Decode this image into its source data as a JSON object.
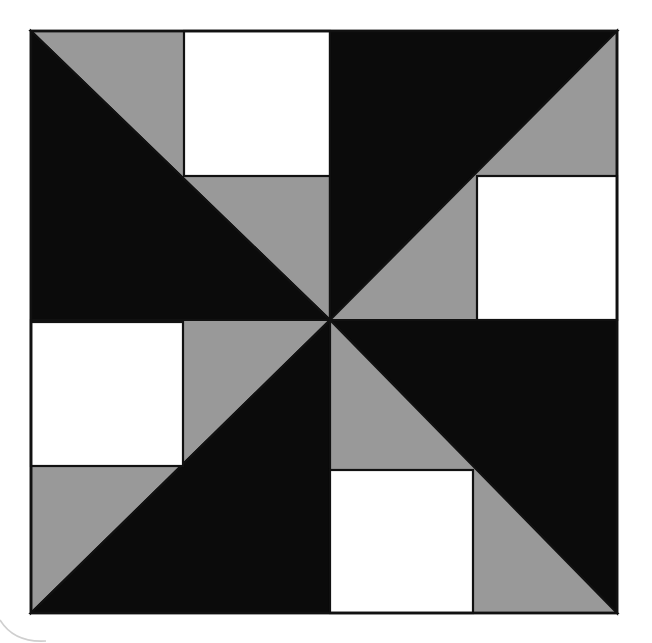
{
  "figure": {
    "name": "pinwheel-quilt-block",
    "kind": "geometric-pattern-diagram",
    "canvas": {
      "width": 652,
      "height": 643,
      "background": "#ffffff"
    },
    "block": {
      "x": 31,
      "y": 31,
      "width": 586,
      "height": 582,
      "center_x": 330,
      "center_y": 320,
      "mid_x": 330,
      "mid_y": 320
    },
    "palette": {
      "black": "#0b0b0b",
      "gray": "#999999",
      "white": "#ffffff",
      "outline": "#111111",
      "background": "#ffffff"
    },
    "stroke_width": 2.2,
    "quadrants": [
      {
        "id": "top-left",
        "bounds": {
          "x0": 31,
          "y0": 31,
          "x1": 330,
          "y1": 320
        },
        "diagonal": "main",
        "upper_fill": "gray",
        "lower_fill": "black",
        "white_square": {
          "position": "top-right",
          "x": 184,
          "y": 31,
          "width": 146,
          "height": 145
        }
      },
      {
        "id": "top-right",
        "bounds": {
          "x0": 330,
          "y0": 31,
          "x1": 617,
          "y1": 320
        },
        "diagonal": "anti",
        "upper_fill": "black",
        "lower_fill": "gray",
        "white_square": {
          "position": "bottom-right",
          "x": 477,
          "y": 176,
          "width": 140,
          "height": 144
        }
      },
      {
        "id": "bottom-left",
        "bounds": {
          "x0": 31,
          "y0": 320,
          "x1": 330,
          "y1": 613
        },
        "diagonal": "anti",
        "upper_fill": "gray",
        "lower_fill": "black",
        "white_square": {
          "position": "top-left",
          "x": 31,
          "y": 322,
          "width": 152,
          "height": 144
        }
      },
      {
        "id": "bottom-right",
        "bounds": {
          "x0": 330,
          "y0": 320,
          "x1": 617,
          "y1": 613
        },
        "diagonal": "main",
        "upper_fill": "black",
        "lower_fill": "gray",
        "white_square": {
          "position": "bottom-left",
          "x": 330,
          "y": 470,
          "width": 143,
          "height": 143
        }
      }
    ],
    "artifact_arc": {
      "name": "faint-arc-mark",
      "d": "M 0 620 Q 14 643 46 641",
      "stroke": "#cfcfcf",
      "stroke_width": 1.6
    }
  }
}
